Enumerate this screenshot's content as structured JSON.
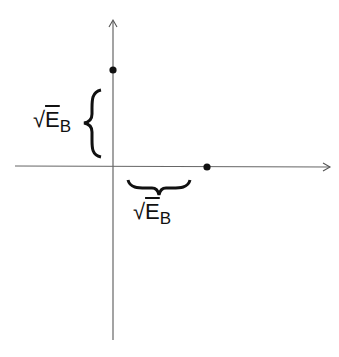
{
  "diagram": {
    "axes": {
      "color": "#555555",
      "vertical": {
        "x": 113,
        "y_top": 20,
        "y_bottom": 340
      },
      "horizontal": {
        "y": 166,
        "x_left": 15,
        "x_right": 330
      }
    },
    "points": [
      {
        "name": "y-axis-point",
        "x": 113,
        "y": 70
      },
      {
        "name": "x-axis-point",
        "x": 207,
        "y": 167
      }
    ],
    "labels": {
      "vertical_brace": {
        "radical": "√",
        "base": "E",
        "subscript": "B"
      },
      "horizontal_brace": {
        "radical": "√",
        "base": "E",
        "subscript": "B"
      }
    }
  }
}
